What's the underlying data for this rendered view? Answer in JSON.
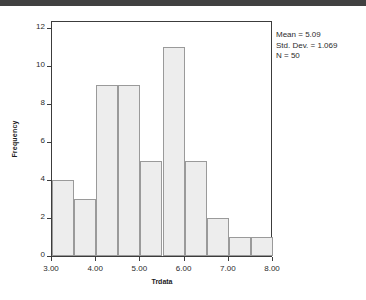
{
  "banner": {
    "color": "#414141"
  },
  "chart_data": {
    "type": "bar",
    "title": "",
    "xlabel": "Trdata",
    "ylabel": "Frequency",
    "bin_width": 0.5,
    "bin_starts": [
      3.0,
      3.5,
      4.0,
      4.5,
      5.0,
      5.5,
      6.0,
      6.5,
      7.0,
      7.5
    ],
    "categories": [
      "3.00-3.50",
      "3.50-4.00",
      "4.00-4.50",
      "4.50-5.00",
      "5.00-5.50",
      "5.50-6.00",
      "6.00-6.50",
      "6.50-7.00",
      "7.00-7.50",
      "7.50-8.00"
    ],
    "values": [
      4,
      3,
      9,
      9,
      5,
      11,
      5,
      2,
      1,
      1
    ],
    "xlim": [
      3.0,
      8.0
    ],
    "ylim": [
      0,
      12.4
    ],
    "x_ticks": [
      3.0,
      4.0,
      5.0,
      6.0,
      7.0,
      8.0
    ],
    "x_tick_labels": [
      "3.00",
      "4.00",
      "5.00",
      "6.00",
      "7.00",
      "8.00"
    ],
    "y_ticks": [
      0,
      2,
      4,
      6,
      8,
      10,
      12
    ],
    "y_tick_labels": [
      "0",
      "2",
      "4",
      "6",
      "8",
      "10",
      "12"
    ],
    "grid": false,
    "legend": "none",
    "bar_fill": "#ededed",
    "bar_border": "#9a9a9a"
  },
  "stats": {
    "mean": "Mean = 5.09",
    "std_dev": "Std. Dev. = 1.069",
    "n": "N = 50"
  }
}
